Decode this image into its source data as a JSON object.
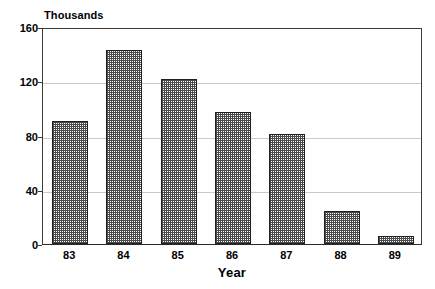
{
  "chart_data": {
    "type": "bar",
    "title": "",
    "subtitle": "",
    "xlabel": "Year",
    "ylabel": "Thousands",
    "categories": [
      "83",
      "84",
      "85",
      "86",
      "87",
      "88",
      "89"
    ],
    "values": [
      91,
      143,
      122,
      97,
      81,
      24,
      6
    ],
    "series": [
      {
        "name": "",
        "values": [
          91,
          143,
          122,
          97,
          81,
          24,
          6
        ]
      }
    ],
    "ylim": [
      0,
      160
    ],
    "yticks": [
      0,
      40,
      80,
      120,
      160
    ],
    "ytick_labels": [
      "0",
      "40",
      "80",
      "120",
      "160"
    ],
    "grid": true,
    "grid_axis": "y",
    "legend": false,
    "legend_position": "none",
    "bar_fill": "checkerboard-hatch",
    "bar_fill_color": "#4a4a4a",
    "bar_edge_color": "#1f1f1f",
    "axis_color": "#3a3a3a",
    "grid_color": "#c9c9c9",
    "background_color": "#ffffff",
    "annotations": []
  },
  "caption_fragment": {
    "text": ""
  }
}
